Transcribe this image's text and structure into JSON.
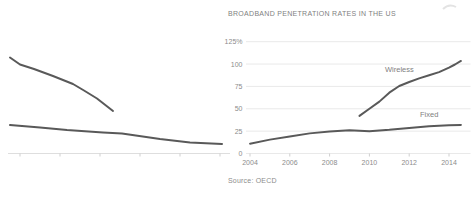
{
  "colors": {
    "line": "#595959",
    "grid": "#e9e9e9",
    "axis": "#dedede",
    "tick": "#cfcfcf",
    "tick_label": "#8c8c8c",
    "title": "#7f7f7f",
    "artifact": "#e3e3e3"
  },
  "chart_data": [
    {
      "id": "left-cropped-chart",
      "type": "line",
      "title": "",
      "note": "left chart is cropped at image edge; no axis or series labels visible",
      "axis": {
        "baseline_y_px": 153.5,
        "x_start_px": 8,
        "x_end_px": 230,
        "tick_x_px": [
          20,
          60,
          100,
          140,
          180,
          220
        ]
      },
      "series": [
        {
          "name": "upper-declining-line",
          "points_px": [
            [
              10,
              57.5
            ],
            [
              20,
              64.5
            ],
            [
              34,
              69
            ],
            [
              53,
              76
            ],
            [
              73,
              84
            ],
            [
              84,
              90.5
            ],
            [
              97,
              98.5
            ],
            [
              113,
              111
            ]
          ]
        },
        {
          "name": "lower-declining-line",
          "points_px": [
            [
              10,
              125
            ],
            [
              40,
              127.5
            ],
            [
              67,
              130
            ],
            [
              103,
              132.5
            ],
            [
              122,
              133.5
            ],
            [
              160,
              139
            ],
            [
              190,
              142.5
            ],
            [
              222,
              144
            ]
          ]
        }
      ]
    },
    {
      "id": "us-broadband-chart",
      "type": "line",
      "title": "BROADBAND PENETRATION RATES IN THE US",
      "source": "Source: OECD",
      "xlabel": "",
      "ylabel": "",
      "grid": true,
      "legend_position": "inline-labels",
      "xlim": [
        2003.8,
        2015.1
      ],
      "ylim": [
        0,
        125
      ],
      "x_ticks": [
        "2004",
        "2006",
        "2008",
        "2010",
        "2012",
        "2014"
      ],
      "x_tick_values": [
        2004,
        2006,
        2008,
        2010,
        2012,
        2014
      ],
      "y_ticks": [
        "125%",
        "100",
        "75",
        "50",
        "25",
        "0"
      ],
      "y_tick_values": [
        125,
        100,
        75,
        50,
        25,
        0
      ],
      "series": [
        {
          "name": "Wireless",
          "x": [
            2009.5,
            2010,
            2010.5,
            2011,
            2011.5,
            2012,
            2012.5,
            2013,
            2013.5,
            2014,
            2014.3,
            2014.6
          ],
          "values": [
            42,
            50,
            58,
            68,
            75.5,
            80,
            84,
            87.5,
            91,
            96,
            99.5,
            103.5
          ]
        },
        {
          "name": "Fixed",
          "x": [
            2004,
            2005,
            2006,
            2007,
            2008,
            2009,
            2010,
            2011,
            2012,
            2013,
            2014,
            2014.6
          ],
          "values": [
            11,
            15.5,
            19,
            22.5,
            24.5,
            26,
            25,
            26.5,
            28.5,
            30.5,
            31.5,
            32
          ]
        }
      ],
      "series_labels": [
        {
          "text": "Wireless"
        },
        {
          "text": "Fixed"
        }
      ]
    }
  ]
}
